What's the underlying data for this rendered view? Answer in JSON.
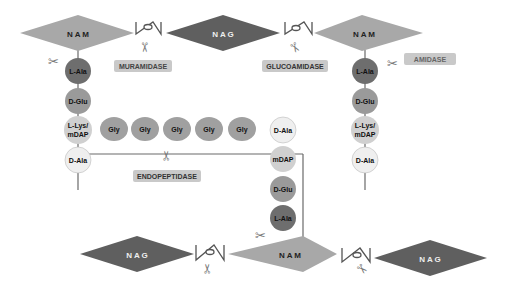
{
  "sugars": {
    "nam_top_left": "N A M",
    "nag_top_mid": "N A G",
    "nam_top_right": "N A M",
    "nag_bottom_left": "N A G",
    "nam_bottom_mid": "N A M",
    "nag_bottom_right": "N A G"
  },
  "enzymes": {
    "muramidase": "MURAMIDASE",
    "glucoamidase": "GLUCOAMIDASE",
    "amidase": "AMIDASE",
    "endopeptidase": "ENDOPEPTIDASE"
  },
  "left_stem": [
    "L-Ala",
    "D-Glu",
    "L-Lys/",
    "mDAP",
    "D-Ala"
  ],
  "right_stem": [
    "L-Ala",
    "D-Glu",
    "L-Lys/",
    "mDAP",
    "D-Ala"
  ],
  "bridge": [
    "Gly",
    "Gly",
    "Gly",
    "Gly",
    "Gly"
  ],
  "center_stem": [
    "D-Ala",
    "mDAP",
    "D-Glu",
    "L-Ala"
  ],
  "colors": {
    "nam": "#a8a8a8",
    "nag": "#5f5f5f",
    "l_ala": "#6e6e6e",
    "d_glu": "#9a9a9a",
    "lys": "#d0d0d0",
    "d_ala": "#efefef",
    "gly": "#a0a0a0",
    "enzyme_bg": "#c9c9c9",
    "link": "#555555"
  }
}
